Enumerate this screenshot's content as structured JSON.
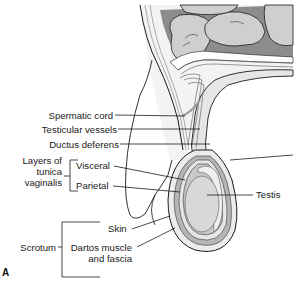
{
  "figure": {
    "panel_label": "A",
    "labels": {
      "spermatic_cord": "Spermatic cord",
      "testicular_vessels": "Testicular vessels",
      "ductus_deferens": "Ductus deferens",
      "layers_group": [
        "Layers of",
        "tunica",
        "vaginalis"
      ],
      "visceral": "Visceral",
      "parietal": "Parietal",
      "testis": "Testis",
      "skin": "Skin",
      "scrotum": "Scrotum",
      "dartos": [
        "Dartos muscle",
        "and fascia"
      ]
    },
    "colors": {
      "outline": "#1a1a1a",
      "intestine": "#cfcfcf",
      "intestine_shadow": "#8c8c8c",
      "layer_light": "#e6e6e6",
      "layer_mid": "#b5b5b5",
      "testis": "#d8d8d8",
      "epididymis": "#efefef"
    }
  }
}
